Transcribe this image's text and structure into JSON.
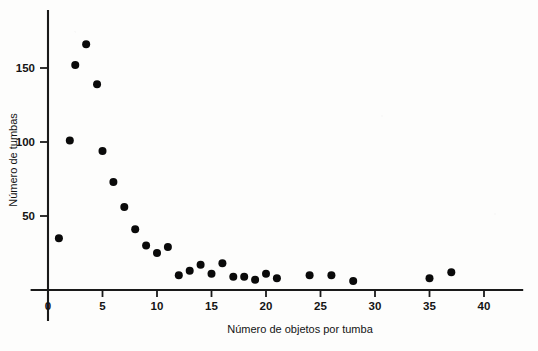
{
  "chart_data": {
    "type": "scatter",
    "title": "",
    "subtitle": "",
    "xlabel": "Número de objetos por tumba",
    "ylabel": "Número de tumbas",
    "xlim": [
      -1.5,
      43.5
    ],
    "ylim": [
      0,
      185
    ],
    "xticks": [
      0,
      5,
      10,
      15,
      20,
      25,
      30,
      35,
      40
    ],
    "xticklabels": [
      "0",
      "5",
      "10",
      "15",
      "20",
      "25",
      "30",
      "35",
      "40"
    ],
    "yticks": [
      50,
      100,
      150
    ],
    "yticklabels": [
      "50",
      "100",
      "150"
    ],
    "grid": false,
    "legend": false,
    "legend_position": "none",
    "marker": "filled-circle",
    "marker_color": "#0a0a0a",
    "marker_size_px": 5.2,
    "axis_color": "#1a1a1a",
    "background_color": "#fdfdfc",
    "x": [
      1,
      2,
      2.5,
      3.5,
      4.5,
      5,
      6,
      7,
      8,
      9,
      10,
      11,
      12,
      13,
      14,
      15,
      16,
      17,
      18,
      19,
      20,
      21,
      24,
      26,
      28,
      35,
      37
    ],
    "y": [
      35,
      101,
      152,
      166,
      139,
      94,
      73,
      56,
      41,
      30,
      25,
      29,
      10,
      13,
      17,
      11,
      18,
      9,
      9,
      7,
      11,
      8,
      10,
      10,
      6,
      8,
      12
    ],
    "points": [
      {
        "x": 1,
        "y": 35
      },
      {
        "x": 2,
        "y": 101
      },
      {
        "x": 2.5,
        "y": 152
      },
      {
        "x": 3.5,
        "y": 166
      },
      {
        "x": 4.5,
        "y": 139
      },
      {
        "x": 5,
        "y": 94
      },
      {
        "x": 6,
        "y": 73
      },
      {
        "x": 7,
        "y": 56
      },
      {
        "x": 8,
        "y": 41
      },
      {
        "x": 9,
        "y": 30
      },
      {
        "x": 10,
        "y": 25
      },
      {
        "x": 11,
        "y": 29
      },
      {
        "x": 12,
        "y": 10
      },
      {
        "x": 13,
        "y": 13
      },
      {
        "x": 14,
        "y": 17
      },
      {
        "x": 15,
        "y": 11
      },
      {
        "x": 16,
        "y": 18
      },
      {
        "x": 17,
        "y": 9
      },
      {
        "x": 18,
        "y": 9
      },
      {
        "x": 19,
        "y": 7
      },
      {
        "x": 20,
        "y": 11
      },
      {
        "x": 21,
        "y": 8
      },
      {
        "x": 24,
        "y": 10
      },
      {
        "x": 26,
        "y": 10
      },
      {
        "x": 28,
        "y": 6
      },
      {
        "x": 35,
        "y": 8
      },
      {
        "x": 37,
        "y": 12
      }
    ]
  }
}
